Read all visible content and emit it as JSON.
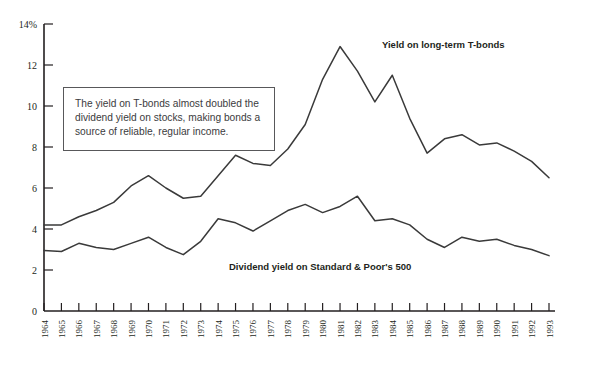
{
  "callout": {
    "text": "The yield on T-bonds almost doubled the dividend yield on stocks, making bonds a source of reliable, regular income."
  },
  "labels": {
    "tbond_series": "Yield on long-term T-bonds",
    "dividend_series": "Dividend yield on Standard & Poor's 500"
  },
  "axis": {
    "y_unit_suffix": "%",
    "y_top_label": "14%"
  },
  "chart_data": {
    "type": "line",
    "title": "",
    "subtitle": "",
    "xlabel": "",
    "ylabel": "",
    "ylim": [
      0,
      14
    ],
    "xlim": [
      1964,
      1993
    ],
    "grid": false,
    "legend_position": "inline-annotation",
    "y_ticks": [
      0,
      2,
      4,
      6,
      8,
      10,
      12,
      14
    ],
    "y_tick_labels": [
      "0",
      "2",
      "4",
      "6",
      "8",
      "10",
      "12",
      "14%"
    ],
    "x": [
      1964,
      1965,
      1966,
      1967,
      1968,
      1969,
      1970,
      1971,
      1972,
      1973,
      1974,
      1975,
      1976,
      1977,
      1978,
      1979,
      1980,
      1981,
      1982,
      1983,
      1984,
      1985,
      1986,
      1987,
      1988,
      1989,
      1990,
      1991,
      1992,
      1993
    ],
    "x_tick_labels": [
      "1964",
      "1965",
      "1966",
      "1967",
      "1968",
      "1969",
      "1970",
      "1971",
      "1972",
      "1973",
      "1974",
      "1975",
      "1976",
      "1977",
      "1978",
      "1979",
      "1980",
      "1981",
      "1982",
      "1983",
      "1984",
      "1985",
      "1986",
      "1987",
      "1988",
      "1989",
      "1990",
      "1991",
      "1992",
      "1993"
    ],
    "series": [
      {
        "name": "Yield on long-term T-bonds",
        "color": "#3a3a3a",
        "values": [
          4.2,
          4.2,
          4.6,
          4.9,
          5.3,
          6.1,
          6.6,
          6.0,
          5.5,
          5.6,
          6.6,
          7.6,
          7.2,
          7.1,
          7.9,
          9.1,
          11.3,
          12.9,
          11.7,
          10.2,
          11.5,
          9.4,
          7.7,
          8.4,
          8.6,
          8.1,
          8.2,
          7.8,
          7.3,
          6.5
        ]
      },
      {
        "name": "Dividend yield on Standard & Poor's 500",
        "color": "#3a3a3a",
        "values": [
          2.95,
          2.9,
          3.3,
          3.1,
          3.0,
          3.3,
          3.6,
          3.1,
          2.75,
          3.4,
          4.5,
          4.3,
          3.9,
          4.4,
          4.9,
          5.2,
          4.8,
          5.1,
          5.6,
          4.4,
          4.5,
          4.2,
          3.5,
          3.1,
          3.6,
          3.4,
          3.5,
          3.2,
          3.0,
          2.7
        ]
      }
    ]
  }
}
